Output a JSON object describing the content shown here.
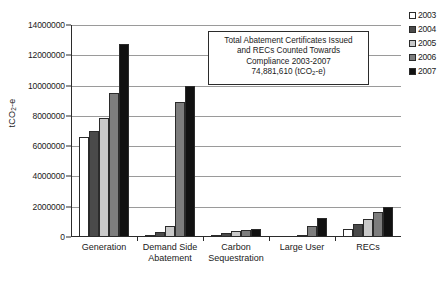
{
  "chart_data": {
    "type": "bar",
    "title": "",
    "xlabel": "",
    "ylabel": "tCO2-e",
    "ylabel_rich": {
      "prefix": "tCO",
      "sub": "2",
      "suffix": "-e"
    },
    "ylim": [
      0,
      14000000
    ],
    "ytick_step": 2000000,
    "ytick_labels": [
      "14000000",
      "12000000",
      "10000000",
      "8000000",
      "6000000",
      "4000000",
      "2000000",
      "0"
    ],
    "ytick_values": [
      14000000,
      12000000,
      10000000,
      8000000,
      6000000,
      4000000,
      2000000,
      0
    ],
    "grid": true,
    "grid_axis": "y",
    "legend_position": "right",
    "categories": [
      "Generation",
      "Demand Side\nAbatement",
      "Carbon\nSequestration",
      "Large User",
      "RECs"
    ],
    "series": [
      {
        "name": "2003",
        "color": "#ffffff",
        "values": [
          6600000,
          100000,
          100000,
          0,
          550000
        ]
      },
      {
        "name": "2004",
        "color": "#4a4a4a",
        "values": [
          7000000,
          350000,
          250000,
          0,
          850000
        ]
      },
      {
        "name": "2005",
        "color": "#c9c9c9",
        "values": [
          7850000,
          750000,
          400000,
          100000,
          1200000
        ]
      },
      {
        "name": "2006",
        "color": "#7d7d7d",
        "values": [
          9500000,
          8900000,
          450000,
          750000,
          1650000
        ]
      },
      {
        "name": "2007",
        "color": "#111111",
        "values": [
          12750000,
          9950000,
          550000,
          1250000,
          1950000
        ]
      }
    ],
    "annotation": {
      "line1": "Total Abatement Certificates Issued",
      "line2": "and RECs Counted Towards",
      "line3": "Compliance 2003-2007",
      "line4_prefix": "74,881,610 (tCO",
      "line4_sub": "2",
      "line4_suffix": "-e)"
    }
  },
  "colors": {
    "axis": "#2b2b2b",
    "grid": "#9a9a9a",
    "background": "#ffffff",
    "text": "#1a1a1a"
  }
}
